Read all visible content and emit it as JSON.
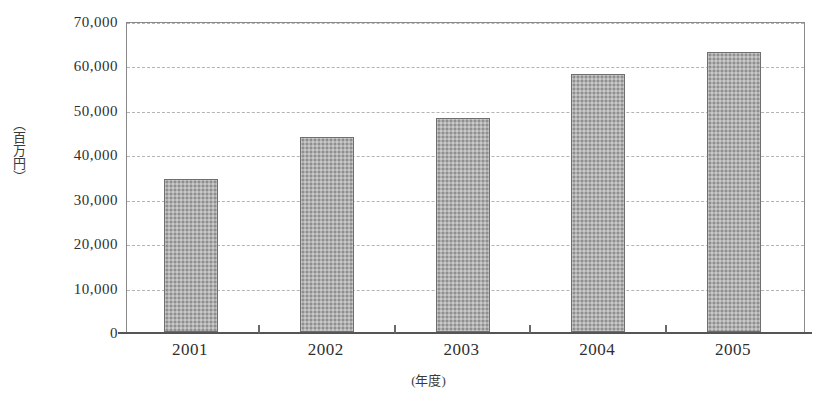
{
  "chart_data": {
    "type": "bar",
    "title": "",
    "categories": [
      "2001",
      "2002",
      "2003",
      "2004",
      "2005"
    ],
    "values": [
      34500,
      44000,
      48200,
      58000,
      63000
    ],
    "xlabel": "(年度)",
    "ylabel": "（百万円）",
    "ylim": [
      0,
      70000
    ],
    "ytick_labels": [
      "70,000",
      "60,000",
      "50,000",
      "40,000",
      "30,000",
      "20,000",
      "10,000",
      "0"
    ],
    "ytick_values": [
      70000,
      60000,
      50000,
      40000,
      30000,
      20000,
      10000,
      0
    ],
    "grid": true,
    "grid_style": "dashed-horizontal",
    "legend": "none",
    "bar_fill_color": "#b0b0b0",
    "bar_edge_color": "#6f6f6f",
    "axis_color": "#555555",
    "gridline_color": "#b4b4b4"
  },
  "yaxis": {
    "unit_label": "（百万円）"
  },
  "xaxis": {
    "unit_label": "(年度)"
  },
  "title_strip": {
    "text": ""
  }
}
